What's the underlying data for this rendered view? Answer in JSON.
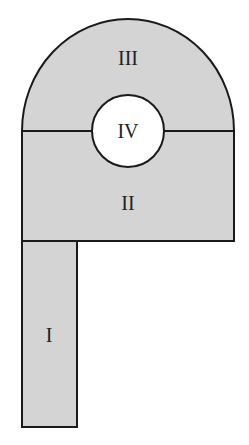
{
  "diagram": {
    "regions": [
      {
        "id": "I",
        "label": "I",
        "shape": "rectangle",
        "fill": "#d4d4d4"
      },
      {
        "id": "II",
        "label": "II",
        "shape": "rectangle",
        "fill": "#d4d4d4"
      },
      {
        "id": "III",
        "label": "III",
        "shape": "semicircle",
        "fill": "#d4d4d4"
      },
      {
        "id": "IV",
        "label": "IV",
        "shape": "circle",
        "fill": "#ffffff"
      }
    ],
    "stroke_color": "#1a1a1a"
  }
}
